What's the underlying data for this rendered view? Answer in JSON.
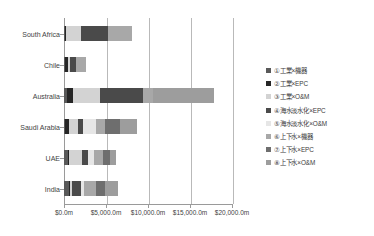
{
  "chart_data": {
    "type": "bar",
    "orientation": "horizontal",
    "stacked": true,
    "title": "",
    "subtitle": "",
    "xlabel": "",
    "ylabel": "",
    "xlim": [
      0,
      20000
    ],
    "xunit": "m",
    "xcurrency": "$",
    "grid": true,
    "grid_axis": "x",
    "legend_position": "right",
    "xticks": [
      0,
      5000,
      10000,
      15000,
      20000
    ],
    "xticklabels": [
      "$0.0m",
      "$5,000.0m",
      "$10,000.0m",
      "$15,000.0m",
      "$20,000.0m"
    ],
    "categories": [
      "South Africa",
      "Chile",
      "Australia",
      "Saudi Arabia",
      "UAE",
      "India"
    ],
    "series": [
      {
        "name": "①工業×機器",
        "color": "#595959",
        "values": [
          130,
          120,
          300,
          120,
          420,
          560
        ]
      },
      {
        "name": "②工業×EPC",
        "color": "#262626",
        "values": [
          60,
          330,
          820,
          480,
          120,
          170
        ]
      },
      {
        "name": "③工業×O&M",
        "color": "#d3d3d3",
        "values": [
          1820,
          230,
          3150,
          1060,
          1600,
          190
        ]
      },
      {
        "name": "④海水淡水化×EPC",
        "color": "#4a4a4a",
        "values": [
          3240,
          790,
          5100,
          620,
          760,
          1150
        ]
      },
      {
        "name": "⑤海水淡水化×O&M",
        "color": "#e6e6e6",
        "values": [
          0,
          0,
          0,
          1540,
          620,
          330
        ]
      },
      {
        "name": "⑥上下水×機器",
        "color": "#a8a8a8",
        "values": [
          2800,
          1180,
          1180,
          1060,
          1120,
          1420
        ]
      },
      {
        "name": "⑦上下水×EPC",
        "color": "#6e6e6e",
        "values": [
          0,
          0,
          0,
          1820,
          820,
          1060
        ]
      },
      {
        "name": "⑧上下水×O&M",
        "color": "#9d9d9d",
        "values": [
          0,
          0,
          7290,
          2000,
          680,
          1550
        ]
      }
    ],
    "totals": [
      8050,
      2650,
      17840,
      8700,
      6140,
      6430
    ]
  }
}
